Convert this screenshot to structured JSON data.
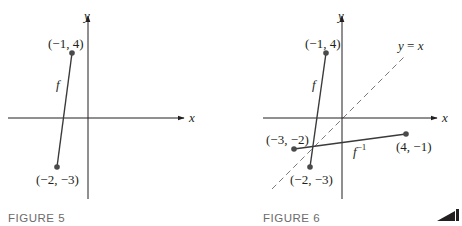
{
  "figures": [
    {
      "caption": "FIGURE 5",
      "axes": {
        "x_label": "x",
        "y_label": "y"
      },
      "segments": [
        {
          "name": "f",
          "label": "f",
          "from": "(−1, 4)",
          "to": "(−2, −3)"
        }
      ],
      "points": [
        {
          "label": "(−1, 4)",
          "x": -1,
          "y": 4
        },
        {
          "label": "(−2, −3)",
          "x": -2,
          "y": -3
        }
      ]
    },
    {
      "caption": "FIGURE 6",
      "axes": {
        "x_label": "x",
        "y_label": "y"
      },
      "reference_line": {
        "label": "y = x",
        "style": "dashed"
      },
      "segments": [
        {
          "name": "f",
          "label": "f",
          "from": "(−1, 4)",
          "to": "(−2, −3)"
        },
        {
          "name": "f-inverse",
          "label": "f",
          "superscript": "−1",
          "from": "(−3, −2)",
          "to": "(4, −1)"
        }
      ],
      "points": [
        {
          "label": "(−1, 4)",
          "x": -1,
          "y": 4
        },
        {
          "label": "(−2, −3)",
          "x": -2,
          "y": -3
        },
        {
          "label": "(−3, −2)",
          "x": -3,
          "y": -2
        },
        {
          "label": "(4, −1)",
          "x": 4,
          "y": -1
        }
      ]
    }
  ],
  "colors": {
    "ink": "#231f20",
    "dashed": "#7a7a7a",
    "caption": "#6b6b6b",
    "point": "#4a4a4a"
  }
}
